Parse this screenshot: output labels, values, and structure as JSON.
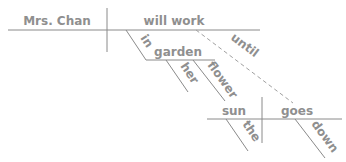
{
  "diagram": {
    "type": "sentence-diagram",
    "main_clause": {
      "subject": "Mrs. Chan",
      "predicate": "will work",
      "prepositional_phrase": {
        "preposition": "in",
        "object": "garden",
        "modifiers": [
          "her",
          "flower"
        ]
      },
      "connector": "until"
    },
    "sub_clause": {
      "subject": "sun",
      "predicate": "goes",
      "subject_modifier": "the",
      "predicate_modifier": "down"
    },
    "colors": {
      "line": "#8a8a8a",
      "text": "#8f8f8f"
    }
  }
}
